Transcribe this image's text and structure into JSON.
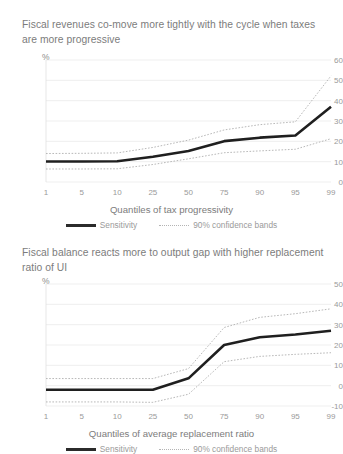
{
  "figure": {
    "background": "#ffffff",
    "series_color": "#1f1f1f",
    "band_color": "#b0b0b0",
    "grid_color": "#e8e8e8"
  },
  "legend": {
    "sensitivity_label": "Sensitivity",
    "bands_label": "90% confidence bands"
  },
  "chart_data": [
    {
      "type": "line",
      "id": "tax-progressivity",
      "title": "Fiscal revenues co-move more tightly with the cycle when taxes are more progressive",
      "unit_label": "%",
      "xlabel": "Quantiles of tax progressivity",
      "ylabel": "",
      "categories": [
        "1",
        "5",
        "10",
        "25",
        "50",
        "75",
        "90",
        "95",
        "99"
      ],
      "ylim": [
        0,
        60
      ],
      "yticks": [
        0,
        10,
        20,
        30,
        40,
        50,
        60
      ],
      "grid": true,
      "legend_position": "bottom",
      "series": [
        {
          "name": "Sensitivity",
          "style": "solid",
          "values": [
            10.1,
            10.1,
            10.2,
            12.4,
            15.2,
            20.1,
            21.8,
            22.9,
            37.0
          ]
        },
        {
          "name": "90% confidence bands upper",
          "style": "dotted",
          "values": [
            14.0,
            14.1,
            14.3,
            17.0,
            20.6,
            25.6,
            28.2,
            29.6,
            52.2
          ]
        },
        {
          "name": "90% confidence bands lower",
          "style": "dotted",
          "values": [
            6.4,
            6.4,
            6.5,
            8.6,
            11.4,
            14.4,
            15.3,
            16.1,
            21.3
          ]
        }
      ]
    },
    {
      "type": "line",
      "id": "replacement-ratio",
      "title": "Fiscal balance reacts more to output gap with higher replacement ratio of UI",
      "unit_label": "%",
      "xlabel": "Quantiles of average replacement ratio",
      "ylabel": "",
      "categories": [
        "1",
        "5",
        "10",
        "25",
        "50",
        "75",
        "90",
        "95",
        "99"
      ],
      "ylim": [
        -10,
        50
      ],
      "yticks": [
        -10,
        0,
        10,
        20,
        30,
        40,
        50
      ],
      "grid": true,
      "legend_position": "bottom",
      "series": [
        {
          "name": "Sensitivity",
          "style": "solid",
          "values": [
            -2.0,
            -2.0,
            -2.0,
            -2.0,
            3.6,
            20.0,
            23.8,
            25.2,
            27.0
          ]
        },
        {
          "name": "90% confidence bands upper",
          "style": "dotted",
          "values": [
            3.5,
            3.5,
            3.5,
            3.5,
            8.4,
            28.6,
            33.6,
            35.4,
            37.8
          ]
        },
        {
          "name": "90% confidence bands lower",
          "style": "dotted",
          "values": [
            -8.0,
            -8.0,
            -8.0,
            -8.2,
            -4.2,
            11.8,
            14.4,
            15.4,
            16.2
          ]
        }
      ]
    }
  ]
}
